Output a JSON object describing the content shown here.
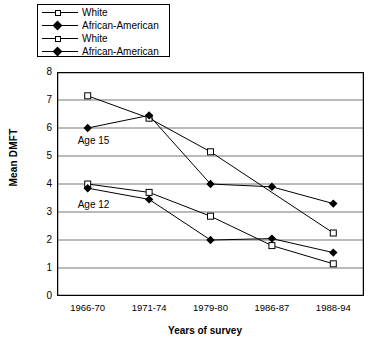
{
  "chart_data": {
    "type": "line",
    "title": "",
    "xlabel": "Years of survey",
    "ylabel": "Mean DMFT",
    "categories": [
      "1966-70",
      "1971-74",
      "1979-80",
      "1986-87",
      "1988-94"
    ],
    "ylim": [
      0,
      8
    ],
    "yticks": [
      0,
      1,
      2,
      3,
      4,
      5,
      6,
      7,
      8
    ],
    "grid": true,
    "legend_position": "top-left",
    "annotations": [
      {
        "text": "Age 15",
        "x": "1966-70",
        "y": 5.55
      },
      {
        "text": "Age 12",
        "x": "1966-70",
        "y": 3.25
      }
    ],
    "series": [
      {
        "name": "White",
        "group": "Age 15",
        "marker": "open-square",
        "color": "#000000",
        "values": [
          7.15,
          6.35,
          5.15,
          null,
          2.25
        ]
      },
      {
        "name": "African-American",
        "group": "Age 15",
        "marker": "filled-diamond",
        "color": "#000000",
        "values": [
          6.0,
          6.45,
          4.0,
          3.9,
          3.3
        ]
      },
      {
        "name": "White",
        "group": "Age 12",
        "marker": "open-square",
        "color": "#000000",
        "values": [
          4.0,
          3.7,
          2.85,
          1.8,
          1.15
        ]
      },
      {
        "name": "African-American",
        "group": "Age 12",
        "marker": "filled-diamond",
        "color": "#000000",
        "values": [
          3.85,
          3.45,
          2.0,
          2.05,
          1.55
        ]
      }
    ]
  },
  "legend": {
    "items": [
      {
        "label": "White",
        "marker": "open-square"
      },
      {
        "label": "African-American",
        "marker": "filled-diamond"
      },
      {
        "label": "White",
        "marker": "open-square"
      },
      {
        "label": "African-American",
        "marker": "filled-diamond"
      }
    ]
  }
}
